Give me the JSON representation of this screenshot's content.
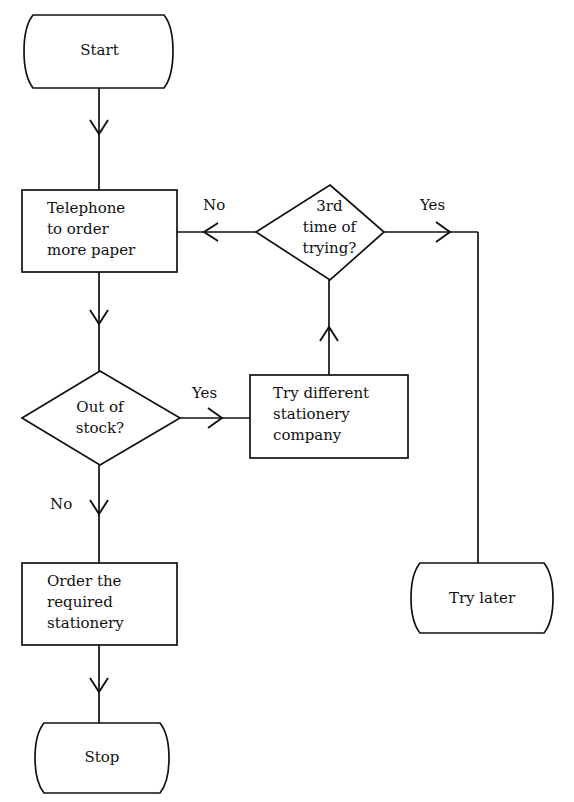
{
  "diagram": {
    "type": "flowchart",
    "stroke_color": "#111111",
    "background_color": "#ffffff",
    "nodes": [
      {
        "id": "start",
        "shape": "terminator",
        "text": "Start"
      },
      {
        "id": "telephone",
        "shape": "process",
        "text": "Telephone\nto order\nmore paper"
      },
      {
        "id": "out_of_stock",
        "shape": "decision",
        "text": "Out of\nstock?"
      },
      {
        "id": "order",
        "shape": "process",
        "text": "Order the\nrequired\nstationery"
      },
      {
        "id": "stop",
        "shape": "terminator",
        "text": "Stop"
      },
      {
        "id": "try_company",
        "shape": "process",
        "text": "Try different\nstationery\ncompany"
      },
      {
        "id": "third_time",
        "shape": "decision",
        "text": "3rd\ntime of\ntrying?"
      },
      {
        "id": "try_later",
        "shape": "terminator",
        "text": "Try later"
      }
    ],
    "edge_labels": {
      "out_of_stock_yes": "Yes",
      "out_of_stock_no": "No",
      "third_time_no": "No",
      "third_time_yes": "Yes"
    }
  }
}
